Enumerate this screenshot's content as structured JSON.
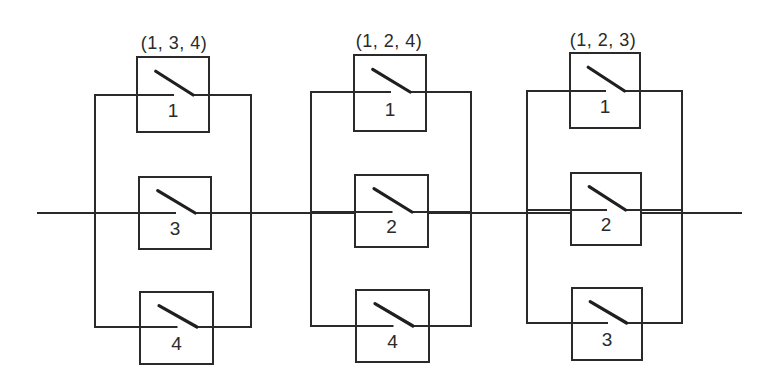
{
  "diagram": {
    "type": "series-parallel switch network",
    "main_line": {
      "x1": 38,
      "x2": 741,
      "y": 213
    },
    "colors": {
      "line": "#2a2a2a",
      "background": "#ffffff"
    },
    "blocks": [
      {
        "label": "(1, 3, 4)",
        "label_pos": {
          "x": 174,
          "y": 49
        },
        "rails": {
          "left_x": 95,
          "right_x": 251,
          "top_y": 95,
          "bottom_y": 327
        },
        "switches": [
          {
            "number": "1",
            "box": {
              "x": 137,
              "y": 57,
              "w": 72,
              "h": 75
            },
            "wire_y": 95
          },
          {
            "number": "3",
            "box": {
              "x": 139,
              "y": 177,
              "w": 72,
              "h": 72
            },
            "wire_y": 213
          },
          {
            "number": "4",
            "box": {
              "x": 140,
              "y": 292,
              "w": 73,
              "h": 72
            },
            "wire_y": 327
          }
        ]
      },
      {
        "label": "(1, 2, 4)",
        "label_pos": {
          "x": 389,
          "y": 47
        },
        "rails": {
          "left_x": 311,
          "right_x": 471,
          "top_y": 92,
          "bottom_y": 326
        },
        "switches": [
          {
            "number": "1",
            "box": {
              "x": 354,
              "y": 55,
              "w": 72,
              "h": 76
            },
            "wire_y": 92
          },
          {
            "number": "2",
            "box": {
              "x": 355,
              "y": 175,
              "w": 73,
              "h": 72
            },
            "wire_y": 212
          },
          {
            "number": "4",
            "box": {
              "x": 356,
              "y": 290,
              "w": 73,
              "h": 72
            },
            "wire_y": 326
          }
        ]
      },
      {
        "label": "(1, 2, 3)",
        "label_pos": {
          "x": 603,
          "y": 46
        },
        "rails": {
          "left_x": 527,
          "right_x": 682,
          "top_y": 91,
          "bottom_y": 323
        },
        "switches": [
          {
            "number": "1",
            "box": {
              "x": 570,
              "y": 53,
              "w": 70,
              "h": 75
            },
            "wire_y": 91
          },
          {
            "number": "2",
            "box": {
              "x": 571,
              "y": 173,
              "w": 70,
              "h": 72
            },
            "wire_y": 210
          },
          {
            "number": "3",
            "box": {
              "x": 572,
              "y": 288,
              "w": 70,
              "h": 72
            },
            "wire_y": 323
          }
        ]
      }
    ]
  }
}
